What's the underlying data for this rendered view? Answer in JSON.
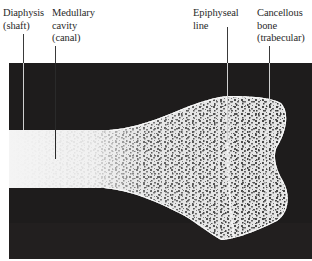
{
  "figure": {
    "type": "labeled anatomical photograph",
    "colors": {
      "background": "#ffffff",
      "photo_background": "#1e1c1c",
      "bone": "#ececec",
      "label_text": "#2a2a2a"
    }
  },
  "labels": [
    {
      "id": "diaphysis",
      "lines": [
        "Diaphysis",
        "(shaft)"
      ]
    },
    {
      "id": "medullary",
      "lines": [
        "Medullary",
        "cavity",
        "(canal)"
      ]
    },
    {
      "id": "epiphyseal",
      "lines": [
        "Epiphyseal",
        "line"
      ]
    },
    {
      "id": "cancellous",
      "lines": [
        "Cancellous",
        "bone",
        "(trabecular)"
      ]
    }
  ]
}
